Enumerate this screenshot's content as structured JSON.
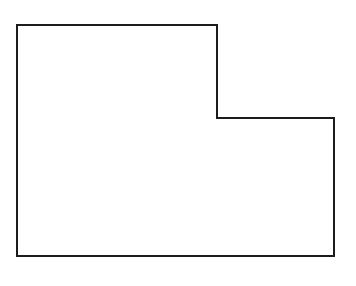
{
  "diagram": {
    "type": "outline-shape",
    "shape_name": "L-shaped step polygon",
    "canvas": {
      "width": 356,
      "height": 286,
      "background": "#ffffff"
    },
    "stroke": {
      "color": "#1c1c1c",
      "width": 2
    },
    "fill": "#ffffff",
    "vertices": [
      [
        17,
        25
      ],
      [
        217,
        25
      ],
      [
        217,
        118
      ],
      [
        334,
        118
      ],
      [
        334,
        256
      ],
      [
        17,
        256
      ]
    ],
    "labels": []
  }
}
